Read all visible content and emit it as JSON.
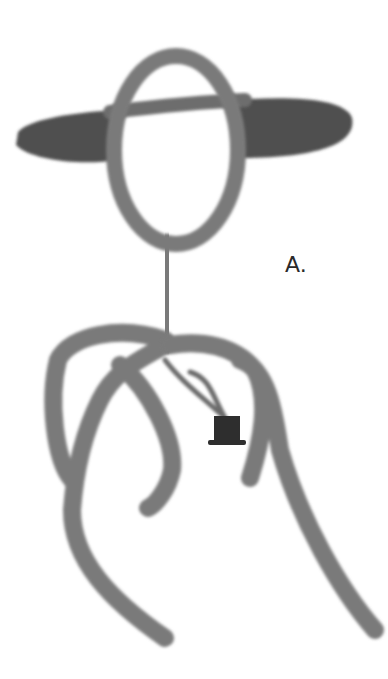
{
  "figure": {
    "label": "A.",
    "colors": {
      "background": "#ffffff",
      "stroke": "#7a7a7a",
      "hat_brim": "#505050",
      "pendant": "#2e2e2e"
    }
  }
}
